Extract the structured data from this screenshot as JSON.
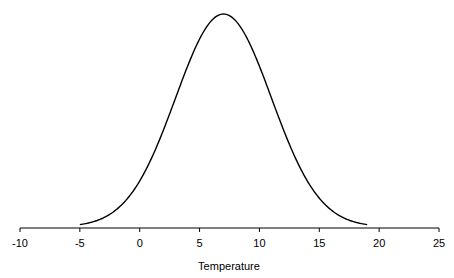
{
  "chart_data": {
    "type": "line",
    "title": "",
    "xlabel": "Temperature",
    "ylabel": "",
    "xlim": [
      -10,
      25
    ],
    "x_ticks": [
      -10,
      -5,
      0,
      5,
      10,
      15,
      20,
      25
    ],
    "x_tick_labels": [
      "-10",
      "-5",
      "0",
      "5",
      "10",
      "15",
      "20",
      "25"
    ],
    "grid": false,
    "legend": null,
    "series": [
      {
        "name": "Normal distribution",
        "distribution": {
          "mean": 7,
          "sd": 4
        },
        "x_range": [
          -5,
          19
        ],
        "color": "#000000"
      }
    ]
  },
  "colors": {
    "curve": "#000000",
    "axis": "#000000",
    "background": "#ffffff"
  }
}
